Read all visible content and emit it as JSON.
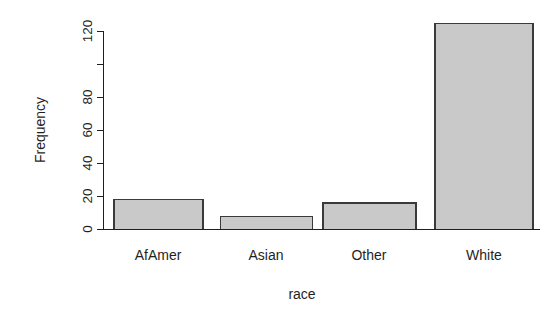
{
  "chart_data": {
    "type": "bar",
    "title": "",
    "subtitle": "",
    "categories": [
      "AfAmer",
      "Asian",
      "Other",
      "White"
    ],
    "values": [
      18,
      8,
      16,
      125
    ],
    "series": [
      {
        "name": "Frequency",
        "values": [
          18,
          8,
          16,
          125
        ]
      }
    ],
    "xlabel": "race",
    "ylabel": "Frequency",
    "ylim": [
      0,
      130
    ],
    "yticks": [
      0,
      20,
      40,
      60,
      80,
      100,
      120
    ],
    "ytick_labels": [
      "0",
      "20",
      "40",
      "60",
      "80",
      "",
      "120"
    ],
    "grid": false,
    "legend": false,
    "legend_position": "none",
    "annotations": [],
    "style": {
      "bar_fill": "#c9c9c9",
      "bar_border": "#3a3a3a",
      "axis_color": "#1f1f1f",
      "background": "#ffffff"
    }
  },
  "axes": {
    "y_axis_title": "Frequency",
    "x_axis_title": "race"
  }
}
